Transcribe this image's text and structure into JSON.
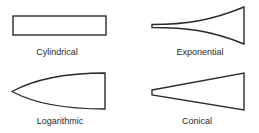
{
  "figure": {
    "panels": [
      {
        "id": "cylindrical",
        "label": "Cylindrical",
        "shape": "rectangle"
      },
      {
        "id": "exponential",
        "label": "Exponential",
        "shape": "exponential-flare"
      },
      {
        "id": "logarithmic",
        "label": "Logarithmic",
        "shape": "logarithmic-convex"
      },
      {
        "id": "conical",
        "label": "Conical",
        "shape": "cone-trapezoid"
      }
    ],
    "colors": {
      "stroke": "#2a2a2a",
      "background": "#ffffff",
      "text": "#2a2a2a"
    }
  }
}
